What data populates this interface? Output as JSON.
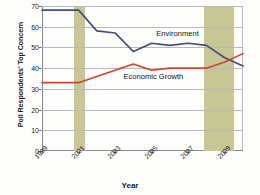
{
  "chart_data": {
    "type": "line",
    "title": "",
    "xlabel": "Year",
    "ylabel": "Poll Respondents' Top Concern",
    "x": [
      1999,
      2000,
      2001,
      2002,
      2003,
      2004,
      2005,
      2006,
      2007,
      2008,
      2009,
      2010
    ],
    "xlim": [
      1999,
      2010
    ],
    "ylim": [
      0,
      70
    ],
    "yticks": [
      0,
      10,
      20,
      30,
      40,
      50,
      60,
      70
    ],
    "xticks": [
      1999,
      2001,
      2003,
      2005,
      2007,
      2009
    ],
    "xtick_labels": [
      "1999",
      "2001",
      "2003",
      "2005",
      "2007",
      "2009"
    ],
    "ytick_labels": [
      "0",
      "10",
      "20",
      "30",
      "40",
      "50",
      "60",
      "70"
    ],
    "grid": true,
    "legend_position": "inline-annotations",
    "series": [
      {
        "name": "Environment",
        "color": "#474a7e",
        "label_x": 2005.2,
        "label_y": 56.5,
        "values": [
          68,
          68,
          68,
          58,
          57,
          48,
          52,
          51,
          52,
          51,
          45,
          41
        ]
      },
      {
        "name": "Economic Growth",
        "color": "#d1432a",
        "label_x": 2003.4,
        "label_y": 35.5,
        "values": [
          33,
          33,
          33,
          36,
          39,
          42,
          39,
          40,
          40,
          40,
          43,
          47
        ]
      }
    ],
    "shaded_bands": [
      {
        "name": "recession-2001",
        "start": 2000.75,
        "end": 2001.35,
        "color": "#c6c794"
      },
      {
        "name": "recession-2008",
        "start": 2007.85,
        "end": 2009.5,
        "color": "#c6c794"
      }
    ]
  }
}
